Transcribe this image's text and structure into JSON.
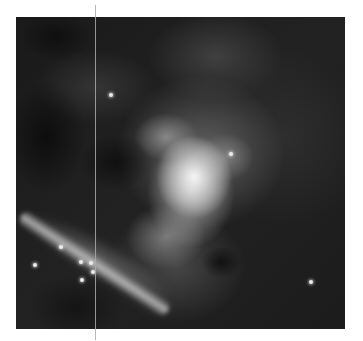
{
  "image": {
    "subject": "Grayscale nebula photograph",
    "background_color": "#ffffff",
    "frame": {
      "x": 16,
      "y": 17,
      "width": 329,
      "height": 312
    },
    "divider_line": {
      "x": 95,
      "color": "#aaaaaa"
    },
    "stars": [
      {
        "x": 19,
        "y": 248
      },
      {
        "x": 45,
        "y": 230
      },
      {
        "x": 65,
        "y": 245
      },
      {
        "x": 66,
        "y": 263
      },
      {
        "x": 75,
        "y": 246
      },
      {
        "x": 77,
        "y": 255
      },
      {
        "x": 295,
        "y": 265
      },
      {
        "x": 215,
        "y": 137
      },
      {
        "x": 95,
        "y": 78
      }
    ]
  }
}
